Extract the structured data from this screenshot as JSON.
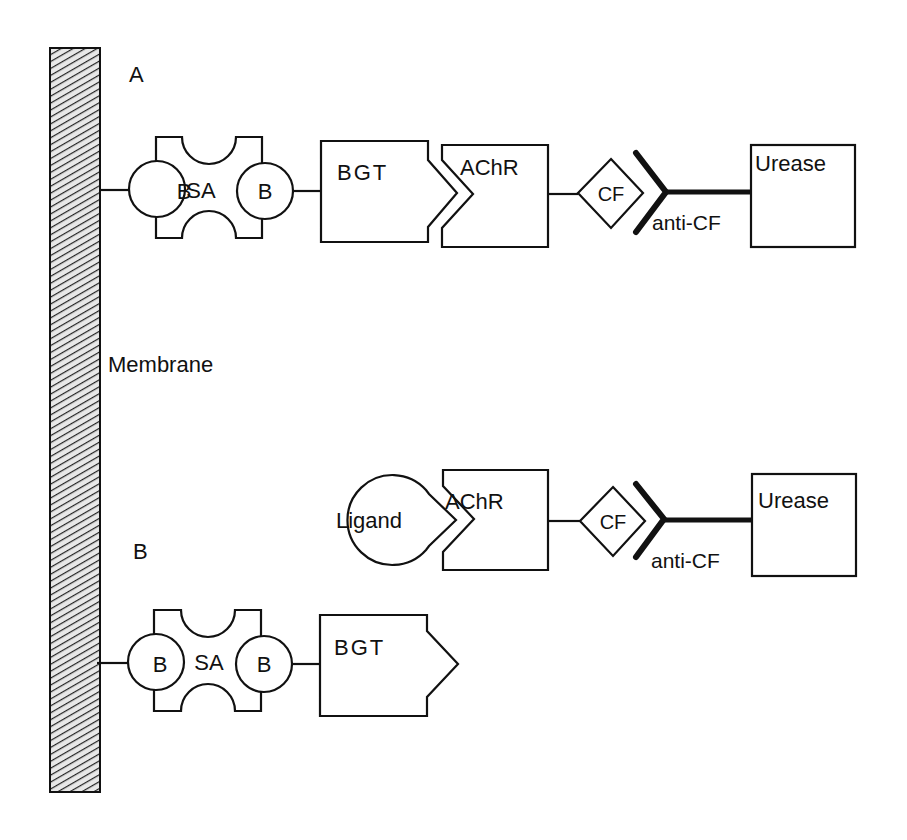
{
  "diagram": {
    "membrane_label": "Membrane",
    "panel_a_label": "A",
    "panel_b_label": "B",
    "panel_a": {
      "biotin_left": "B",
      "streptavidin": "SA",
      "biotin_right": "B",
      "bgt": "BGT",
      "achr": "AChR",
      "cf": "CF",
      "anti_cf": "anti-CF",
      "urease": "Urease"
    },
    "panel_b_released": {
      "ligand": "Ligand",
      "achr": "AChR",
      "cf": "CF",
      "anti_cf": "anti-CF",
      "urease": "Urease"
    },
    "panel_b_bound": {
      "biotin_left": "B",
      "streptavidin": "SA",
      "biotin_right": "B",
      "bgt": "BGT"
    }
  },
  "colors": {
    "ink": "#111111",
    "background": "#ffffff"
  }
}
